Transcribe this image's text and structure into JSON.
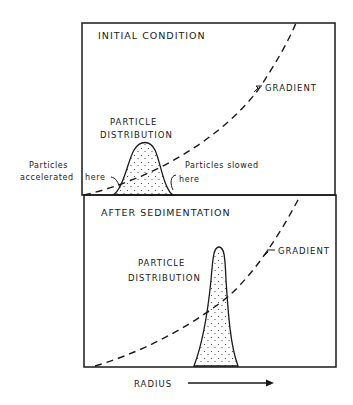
{
  "figure": {
    "panels": [
      {
        "title": "INITIAL CONDITION",
        "gradient_label": "GRADIENT",
        "distribution_label_line1": "PARTICLE",
        "distribution_label_line2": "DISTRIBUTION",
        "left_annotation_line1": "Particles",
        "left_annotation_line2": "accelerated",
        "left_annotation_here": "here",
        "right_annotation_line1": "Particles slowed",
        "right_annotation_here": "here"
      },
      {
        "title": "AFTER SEDIMENTATION",
        "gradient_label": "GRADIENT",
        "distribution_label_line1": "PARTICLE",
        "distribution_label_line2": "DISTRIBUTION"
      }
    ],
    "x_axis_label": "RADIUS",
    "colors": {
      "ink": "#1a1a1a",
      "background": "#ffffff"
    }
  }
}
